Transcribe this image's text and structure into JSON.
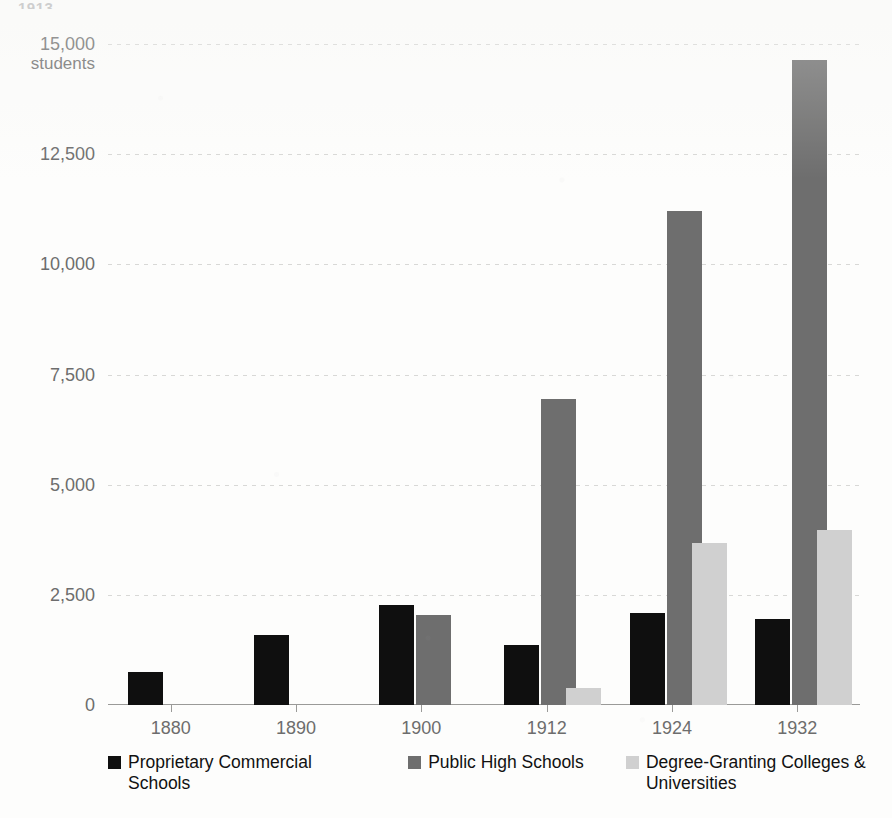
{
  "page": {
    "top_cut_text": "1913"
  },
  "chart_data": {
    "type": "bar",
    "title": "",
    "subtitle": "",
    "xlabel": "",
    "ylabel": "students",
    "categories": [
      "1880",
      "1890",
      "1900",
      "1912",
      "1924",
      "1932"
    ],
    "series": [
      {
        "name": "Proprietary Commercial Schools",
        "color": "#0f0f0f",
        "values": [
          750,
          1590,
          2270,
          1360,
          2090,
          1950
        ]
      },
      {
        "name": "Public High Schools",
        "color": "#6e6e6e",
        "values": [
          null,
          null,
          2040,
          6950,
          11210,
          14640
        ]
      },
      {
        "name": "Degree-Granting Colleges & Universities",
        "color": "#d0d0d0",
        "values": [
          null,
          null,
          null,
          390,
          3680,
          3970
        ]
      }
    ],
    "ylim": [
      0,
      15000
    ],
    "yticks": [
      0,
      2500,
      5000,
      7500,
      10000,
      12500,
      15000
    ],
    "ytick_labels": [
      "0",
      "2,500",
      "5,000",
      "7,500",
      "10,000",
      "12,500",
      "15,000"
    ],
    "y_unit_label": "students",
    "grid": true,
    "legend_position": "bottom"
  },
  "legend": {
    "items": [
      {
        "label": "Proprietary Commercial Schools",
        "color": "#0f0f0f"
      },
      {
        "label": "Public High Schools",
        "color": "#6e6e6e"
      },
      {
        "label": "Degree-Granting Colleges & Universities",
        "color": "#d0d0d0"
      }
    ]
  }
}
